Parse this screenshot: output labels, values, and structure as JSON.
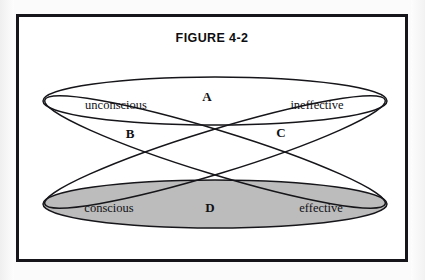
{
  "figure": {
    "title": "FIGURE 4-2",
    "frame_color": "#16161a",
    "page_background": "#fbfbfb",
    "frame_background": "#ffffff"
  },
  "diagram": {
    "type": "venn-ellipses",
    "shaded_fill": "#bcbcbc",
    "stroke_color": "#16161a",
    "set_labels": [
      {
        "id": "unconscious",
        "text": "unconscious",
        "x": 97,
        "y": 88,
        "shaded": false
      },
      {
        "id": "ineffective",
        "text": "ineffective",
        "x": 298,
        "y": 88,
        "shaded": false
      },
      {
        "id": "conscious",
        "text": "conscious",
        "x": 90,
        "y": 191,
        "shaded": true
      },
      {
        "id": "effective",
        "text": "effective",
        "x": 302,
        "y": 191,
        "shaded": true
      }
    ],
    "region_labels": [
      {
        "id": "A",
        "text": "A",
        "x": 188,
        "y": 80
      },
      {
        "id": "B",
        "text": "B",
        "x": 111,
        "y": 117
      },
      {
        "id": "C",
        "text": "C",
        "x": 262,
        "y": 116
      },
      {
        "id": "D",
        "text": "D",
        "x": 191,
        "y": 191
      }
    ],
    "ellipses": [
      {
        "id": "top-horizontal",
        "cx": 196,
        "cy": 84,
        "rx": 172,
        "ry": 24,
        "rotate": 0,
        "fill": "none"
      },
      {
        "id": "bottom-horizontal",
        "cx": 196,
        "cy": 187,
        "rx": 172,
        "ry": 24,
        "rotate": 0,
        "fill": "#bcbcbc"
      },
      {
        "id": "diagonal-down-right",
        "cx": 196,
        "cy": 135,
        "rx": 178,
        "ry": 22,
        "rotate": 17,
        "fill": "none"
      },
      {
        "id": "diagonal-down-left",
        "cx": 196,
        "cy": 135,
        "rx": 178,
        "ry": 22,
        "rotate": -17,
        "fill": "none"
      }
    ]
  }
}
